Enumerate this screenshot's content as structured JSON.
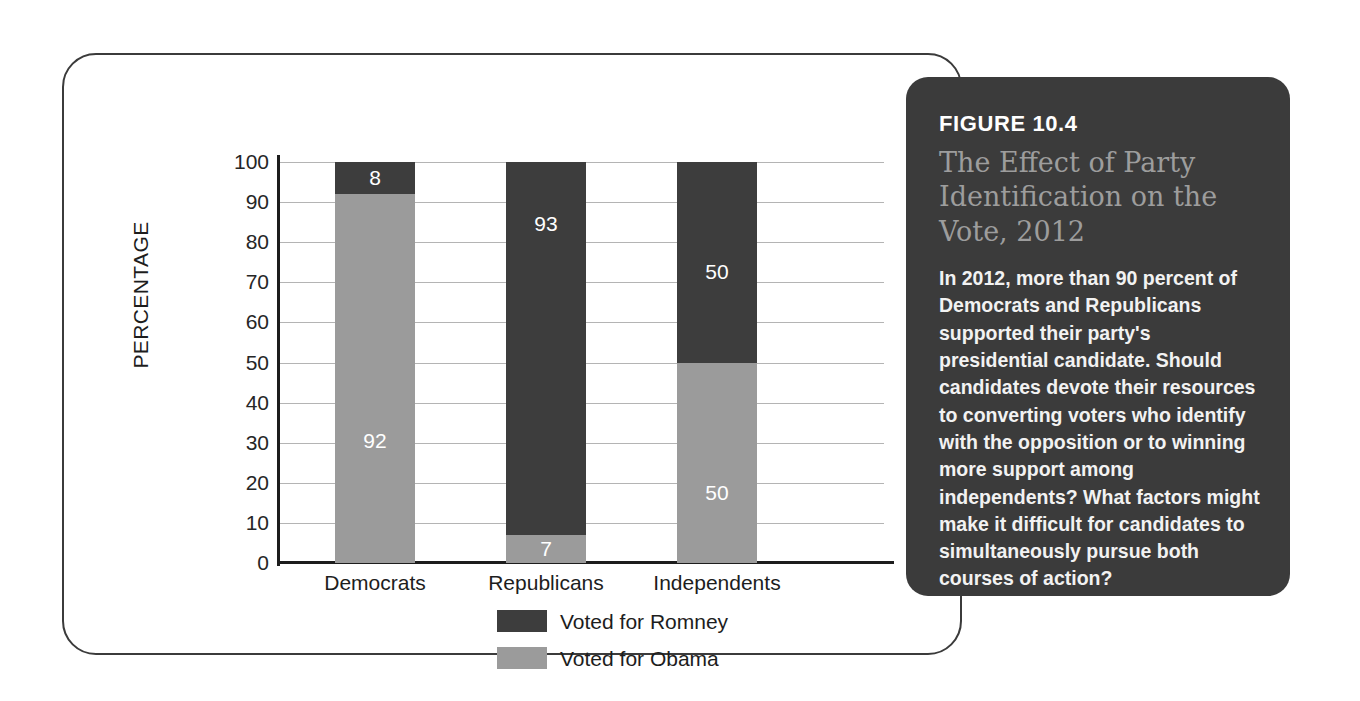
{
  "figure": {
    "number": "FIGURE 10.4",
    "title": "The Effect of Party Identification on the Vote, 2012",
    "caption": "In 2012, more than 90 percent of Democrats and Republicans supported their party's presidential candidate. Should candidates devote their resources to converting voters who identify with the opposition or to winning more support among independents? What factors might make it difficult for candidates to simultaneously pursue both courses of action?"
  },
  "colors": {
    "romney": "#3d3d3d",
    "obama": "#9b9b9b",
    "box_background": "#3b3b3b",
    "title_text": "#9d9d9d",
    "gridline": "#b4b4b4",
    "axis": "#1d1d1d"
  },
  "chart_data": {
    "type": "bar",
    "stacked": true,
    "title": "",
    "xlabel": "",
    "ylabel": "PERCENTAGE",
    "ylim": [
      0,
      100
    ],
    "yticks": [
      0,
      10,
      20,
      30,
      40,
      50,
      60,
      70,
      80,
      90,
      100
    ],
    "ytick_labels": [
      "0",
      "10",
      "20",
      "30",
      "40",
      "50",
      "60",
      "70",
      "80",
      "90",
      "100"
    ],
    "grid": true,
    "legend_position": "bottom-center",
    "categories": [
      "Democrats",
      "Republicans",
      "Independents"
    ],
    "series": [
      {
        "name": "Voted for Romney",
        "color": "#3d3d3d",
        "values": [
          8,
          93,
          50
        ]
      },
      {
        "name": "Voted for Obama",
        "color": "#9b9b9b",
        "values": [
          92,
          7,
          50
        ]
      }
    ],
    "bars": [
      {
        "category": "Democrats",
        "segments": [
          {
            "series": "Voted for Romney",
            "value": 8,
            "label": "8",
            "color": "#3d3d3d"
          },
          {
            "series": "Voted for Obama",
            "value": 92,
            "label": "92",
            "color": "#9b9b9b"
          }
        ]
      },
      {
        "category": "Republicans",
        "segments": [
          {
            "series": "Voted for Romney",
            "value": 93,
            "label": "93",
            "color": "#3d3d3d"
          },
          {
            "series": "Voted for Obama",
            "value": 7,
            "label": "7",
            "color": "#9b9b9b"
          }
        ]
      },
      {
        "category": "Independents",
        "segments": [
          {
            "series": "Voted for Romney",
            "value": 50,
            "label": "50",
            "color": "#3d3d3d"
          },
          {
            "series": "Voted for Obama",
            "value": 50,
            "label": "50",
            "color": "#9b9b9b"
          }
        ]
      }
    ]
  }
}
